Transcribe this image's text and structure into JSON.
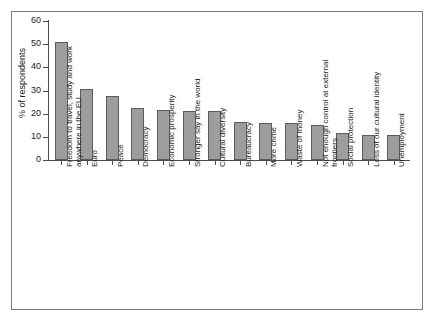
{
  "chart_data": {
    "type": "bar",
    "title": "",
    "subtitle": "",
    "xlabel": "",
    "ylabel": "% of respondents",
    "ylim": [
      0,
      60
    ],
    "yticks": [
      0,
      10,
      20,
      30,
      40,
      50,
      60
    ],
    "ytick_labels": [
      "0",
      "10",
      "20",
      "30",
      "40",
      "50",
      "60"
    ],
    "grid": false,
    "legend": "none",
    "bar_color": "#9d9d9d",
    "bar_edge_color": "#5c5c5c",
    "axis_color": "#4d4d4d",
    "frame_color": "#7a7a7a",
    "background": "#ffffff",
    "categories": [
      "Freedom to travel, study and work anywhere in the EU",
      "Euro",
      "Peace",
      "Democracy",
      "Economic prosperity",
      "Stronger say in the world",
      "Cultural diversity",
      "Bureaucracy",
      "More crime",
      "Waste of money",
      "Not enough control at external frontiers",
      "Social protection",
      "Loss of our cultural identity",
      "Unemployment"
    ],
    "values": [
      51,
      30.5,
      27.5,
      22.5,
      21.5,
      21,
      21,
      16.5,
      16,
      16,
      15,
      11.5,
      11,
      11
    ]
  }
}
